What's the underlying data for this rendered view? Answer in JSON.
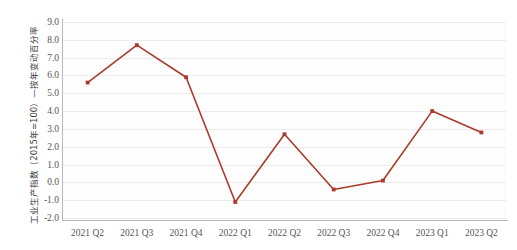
{
  "chart_data": {
    "type": "line",
    "title": "",
    "subtitle": "",
    "xlabel": "",
    "ylabel": "工业生产指数（2015年=100）—按年变动百分率",
    "categories": [
      "2021 Q2",
      "2021 Q3",
      "2021 Q4",
      "2022 Q1",
      "2022 Q2",
      "2022 Q3",
      "2022 Q4",
      "2023 Q1",
      "2023 Q2"
    ],
    "values": [
      5.6,
      7.7,
      5.9,
      -1.1,
      2.7,
      -0.4,
      0.1,
      4.0,
      2.8
    ],
    "series": [
      {
        "name": "工业生产指数按年变动百分率",
        "color": "#a93b2b",
        "values": [
          5.6,
          7.7,
          5.9,
          -1.1,
          2.7,
          -0.4,
          0.1,
          4.0,
          2.8
        ]
      }
    ],
    "ylim": [
      -2.0,
      9.0
    ],
    "yticks": [
      "9.0",
      "8.0",
      "7.0",
      "6.0",
      "5.0",
      "4.0",
      "3.0",
      "2.0",
      "1.0",
      "0.0",
      "-1.0",
      "-2.0"
    ],
    "ytick_values": [
      9.0,
      8.0,
      7.0,
      6.0,
      5.0,
      4.0,
      3.0,
      2.0,
      1.0,
      0.0,
      -1.0,
      -2.0
    ],
    "grid": true,
    "legend": "none",
    "marker": "square",
    "line_color": "#a93b2b",
    "grid_color": "#ececec",
    "axis_color": "#b9b9b9",
    "tick_label_color": "#555555",
    "background": "#ffffff"
  }
}
